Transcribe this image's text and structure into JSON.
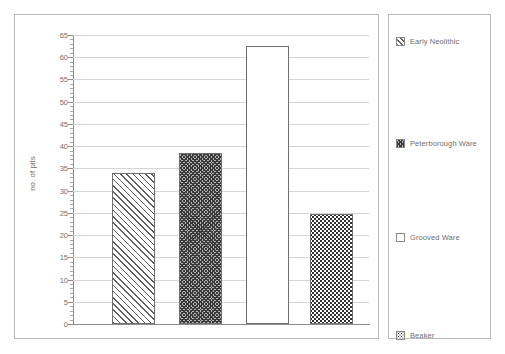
{
  "chart_data": {
    "type": "bar",
    "title": "",
    "xlabel": "",
    "ylabel": "no. of pits",
    "ylim": [
      0,
      65
    ],
    "ytick_step": 5,
    "grid": true,
    "legend_position": "right",
    "categories": [
      "Early Neolithic",
      "Peterborough Ware",
      "Grooved Ware",
      "Beaker"
    ],
    "values": [
      34,
      38.5,
      62.5,
      24.8
    ],
    "ytick_labels": [
      "0",
      "5",
      "10",
      "15",
      "20",
      "25",
      "30",
      "35",
      "40",
      "45",
      "50",
      "55",
      "60",
      "65"
    ],
    "series": [
      {
        "name": "pit counts by ceramic phase",
        "values": [
          34,
          38.5,
          62.5,
          24.8
        ]
      }
    ],
    "bar_patterns": [
      "diagonal-hatch",
      "dense-crosshatch",
      "empty-white",
      "stipple-dots"
    ]
  },
  "axis": {
    "y_label": "no. of pits",
    "y_ticks": [
      "0",
      "5",
      "10",
      "15",
      "20",
      "25",
      "30",
      "35",
      "40",
      "45",
      "50",
      "55",
      "60",
      "65"
    ]
  },
  "legend": {
    "entries": [
      {
        "label": "Early Neolithic",
        "pattern": "diagonal-hatch"
      },
      {
        "label": "Peterborough Ware",
        "pattern": "dense-crosshatch"
      },
      {
        "label": "Grooved Ware",
        "pattern": "empty-white"
      },
      {
        "label": "Beaker",
        "pattern": "stipple-dots"
      }
    ]
  },
  "caption": {
    "text": ""
  },
  "colors": {
    "frame": "#b9b9b9",
    "axis": "#8d8d8d",
    "grid": "#d5d5d5",
    "text": "#6f6f6f",
    "bar_outline": "#6f6f6f"
  }
}
